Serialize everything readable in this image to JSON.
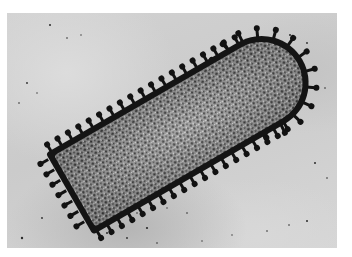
{
  "image": {
    "kind": "electron-micrograph",
    "subject": "rod-shaped enveloped virus particle with surface spikes",
    "palette": {
      "background": "#ffffff",
      "field": "#cfcfcf",
      "membrane": "#141414",
      "core_dark": "#3a3a3a",
      "core_light": "#b8b8b8"
    }
  }
}
